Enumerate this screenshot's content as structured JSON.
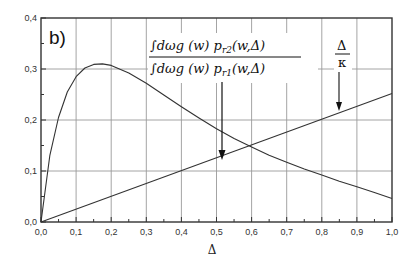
{
  "chart_data": {
    "type": "line",
    "title": "",
    "panel_label": "b)",
    "xlabel": "Δ",
    "ylabel": "",
    "xlim": [
      0.0,
      1.0
    ],
    "ylim": [
      0.0,
      0.4
    ],
    "grid": true,
    "x_ticks": [
      "0,0",
      "0,1",
      "0,2",
      "0,3",
      "0,4",
      "0,5",
      "0,6",
      "0,7",
      "0,8",
      "0,9",
      "1,0"
    ],
    "y_ticks": [
      "0,0",
      "0,1",
      "0,2",
      "0,3",
      "0,4"
    ],
    "series": [
      {
        "name": "∫dωg(ω)p_r2(ω,Δ) / ∫dωg(ω)p_r1(ω,Δ)",
        "x": [
          0.0,
          0.025,
          0.05,
          0.075,
          0.1,
          0.125,
          0.15,
          0.175,
          0.2,
          0.25,
          0.3,
          0.35,
          0.4,
          0.45,
          0.5,
          0.55,
          0.6,
          0.65,
          0.7,
          0.75,
          0.8,
          0.85,
          0.9,
          0.95,
          1.0
        ],
        "values": [
          0.0,
          0.13,
          0.205,
          0.255,
          0.285,
          0.302,
          0.309,
          0.31,
          0.307,
          0.292,
          0.272,
          0.249,
          0.226,
          0.204,
          0.183,
          0.164,
          0.147,
          0.131,
          0.117,
          0.104,
          0.092,
          0.08,
          0.069,
          0.058,
          0.046
        ]
      },
      {
        "name": "Δ/κ",
        "x": [
          0.0,
          1.0
        ],
        "values": [
          0.0,
          0.252
        ]
      }
    ],
    "annotations": [
      {
        "text": "∫dωg(ω)p_r2(ω,Δ) / ∫dωg(ω)p_r1(ω,Δ)",
        "arrow_to": [
          0.52,
          0.19
        ]
      },
      {
        "text": "Δ/κ",
        "arrow_to": [
          0.85,
          0.215
        ]
      }
    ]
  },
  "labels": {
    "panel": "b)",
    "xlabel": "Δ",
    "formula_num": "∫dωg  (w) p",
    "formula_num_sub": "r2",
    "formula_num_tail": "(w,Δ)",
    "formula_den": "∫dωg  (w) p",
    "formula_den_sub": "r1",
    "formula_den_tail": "(w,Δ)",
    "kappa_num": "Δ",
    "kappa_den": "κ"
  }
}
